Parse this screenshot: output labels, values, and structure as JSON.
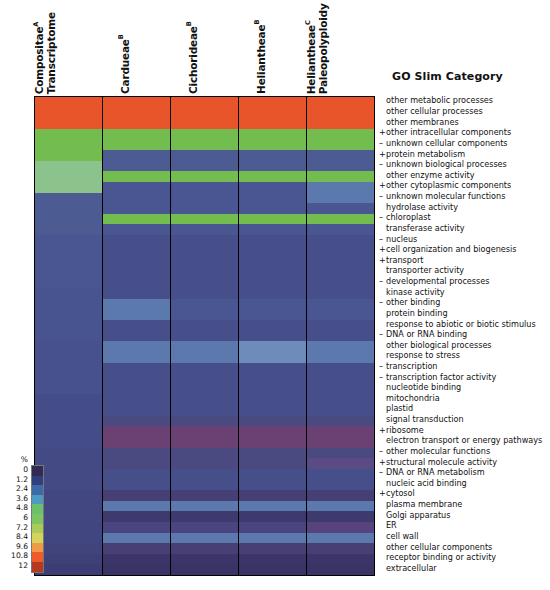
{
  "figure": {
    "type": "heatmap",
    "row_label_header": "GO Slim Category",
    "legend_unit": "%"
  },
  "columns": [
    {
      "id": "compositae-transcriptome",
      "lines": [
        "Compositae",
        "Transcriptome"
      ],
      "superscript": "A"
    },
    {
      "id": "cardueae",
      "lines": [
        "Cardueae"
      ],
      "superscript": "B"
    },
    {
      "id": "cichorideae",
      "lines": [
        "Cichorideae"
      ],
      "superscript": "B"
    },
    {
      "id": "heliantheae",
      "lines": [
        "Heliantheae"
      ],
      "superscript": "B"
    },
    {
      "id": "heliantheae-paleopolyploidy",
      "lines": [
        "Heliantheae",
        "Paleopolyploidy"
      ],
      "superscript": "C"
    }
  ],
  "rows": [
    {
      "prefix": "",
      "label": "other metabolic processes"
    },
    {
      "prefix": "",
      "label": "other cellular processes"
    },
    {
      "prefix": "",
      "label": "other membranes"
    },
    {
      "prefix": "+",
      "label": "other intracellular components"
    },
    {
      "prefix": "–",
      "label": "unknown cellular components"
    },
    {
      "prefix": "+",
      "label": "protein metabolism"
    },
    {
      "prefix": "–",
      "label": "unknown biological processes"
    },
    {
      "prefix": "",
      "label": "other enzyme activity"
    },
    {
      "prefix": "+",
      "label": "other cytoplasmic components"
    },
    {
      "prefix": "–",
      "label": "unknown molecular functions"
    },
    {
      "prefix": "",
      "label": "hydrolase activity"
    },
    {
      "prefix": "–",
      "label": "chloroplast"
    },
    {
      "prefix": "",
      "label": "transferase activity"
    },
    {
      "prefix": "–",
      "label": "nucleus"
    },
    {
      "prefix": "+",
      "label": "cell organization and biogenesis"
    },
    {
      "prefix": "+",
      "label": "transport"
    },
    {
      "prefix": "",
      "label": "transporter activity"
    },
    {
      "prefix": "–",
      "label": "developmental processes"
    },
    {
      "prefix": "",
      "label": "kinase activity"
    },
    {
      "prefix": "–",
      "label": "other binding"
    },
    {
      "prefix": "",
      "label": "protein binding"
    },
    {
      "prefix": "",
      "label": "response to abiotic or biotic stimulus"
    },
    {
      "prefix": "–",
      "label": "DNA or RNA binding"
    },
    {
      "prefix": "",
      "label": "other biological processes"
    },
    {
      "prefix": "",
      "label": "response to stress"
    },
    {
      "prefix": "–",
      "label": "transcription"
    },
    {
      "prefix": "–",
      "label": "transcription factor activity"
    },
    {
      "prefix": "",
      "label": "nucleotide binding"
    },
    {
      "prefix": "",
      "label": "mitochondria"
    },
    {
      "prefix": "",
      "label": "plastid"
    },
    {
      "prefix": "",
      "label": "signal transduction"
    },
    {
      "prefix": "+",
      "label": "ribosome"
    },
    {
      "prefix": "",
      "label": "electron transport or energy pathways"
    },
    {
      "prefix": "–",
      "label": "other molecular functions"
    },
    {
      "prefix": "+",
      "label": "structural molecule activity"
    },
    {
      "prefix": "–",
      "label": "DNA or RNA metabolism"
    },
    {
      "prefix": "",
      "label": "nucleic acid binding"
    },
    {
      "prefix": "+",
      "label": "cytosol"
    },
    {
      "prefix": "",
      "label": "plasma membrane"
    },
    {
      "prefix": "",
      "label": "Golgi apparatus"
    },
    {
      "prefix": "",
      "label": "ER"
    },
    {
      "prefix": "",
      "label": "cell wall"
    },
    {
      "prefix": "",
      "label": "other cellular components"
    },
    {
      "prefix": "",
      "label": "receptor binding or activity"
    },
    {
      "prefix": "",
      "label": "extracellular"
    }
  ],
  "legend": {
    "unit": "%",
    "ticks": [
      "0",
      "1.2",
      "2.4",
      "3.6",
      "4.8",
      "6",
      "7.2",
      "8.4",
      "9.6",
      "10.8",
      "12"
    ],
    "swatches": [
      "#312a52",
      "#30407e",
      "#3f6aa8",
      "#4b9bc4",
      "#6cc06a",
      "#7ec463",
      "#a8cb5a",
      "#d6d25a",
      "#ef9a46",
      "#ef5a28",
      "#b4391f"
    ]
  },
  "chart_data": {
    "type": "heatmap",
    "title": "",
    "xlabel": "",
    "ylabel": "GO Slim Category",
    "colorbar_label": "%",
    "colorbar_range": [
      0,
      12
    ],
    "colorbar_step": 1.2,
    "x_categories": [
      "Compositae Transcriptome",
      "Cardueae",
      "Cichorideae",
      "Heliantheae",
      "Heliantheae Paleopolyploidy"
    ],
    "y_categories": [
      "other metabolic processes",
      "other cellular processes",
      "other membranes",
      "other intracellular components",
      "unknown cellular components",
      "protein metabolism",
      "unknown biological processes",
      "other enzyme activity",
      "other cytoplasmic components",
      "unknown molecular functions",
      "hydrolase activity",
      "chloroplast",
      "transferase activity",
      "nucleus",
      "cell organization and biogenesis",
      "transport",
      "transporter activity",
      "developmental processes",
      "kinase activity",
      "other binding",
      "protein binding",
      "response to abiotic or biotic stimulus",
      "DNA or RNA binding",
      "other biological processes",
      "response to stress",
      "transcription",
      "transcription factor activity",
      "nucleotide binding",
      "mitochondria",
      "plastid",
      "signal transduction",
      "ribosome",
      "electron transport or energy pathways",
      "other molecular functions",
      "structural molecule activity",
      "DNA or RNA metabolism",
      "nucleic acid binding",
      "cytosol",
      "plasma membrane",
      "Golgi apparatus",
      "ER",
      "cell wall",
      "other cellular components",
      "receptor binding or activity",
      "extracellular"
    ],
    "values": [
      [
        10.9,
        10.9,
        10.9,
        10.9,
        10.9
      ],
      [
        10.9,
        10.9,
        10.9,
        10.9,
        10.9
      ],
      [
        10.9,
        10.4,
        10.4,
        10.4,
        10.4
      ],
      [
        6.2,
        6.3,
        6.3,
        6.3,
        6.3
      ],
      [
        6.2,
        6.1,
        6.1,
        6.1,
        6.1
      ],
      [
        6.2,
        2.1,
        2.1,
        2.1,
        2.1
      ],
      [
        5.2,
        2.0,
        2.0,
        2.0,
        2.0
      ],
      [
        5.2,
        5.9,
        5.9,
        5.9,
        5.9
      ],
      [
        5.2,
        1.9,
        1.9,
        1.9,
        2.8
      ],
      [
        2.0,
        1.9,
        1.9,
        1.9,
        2.7
      ],
      [
        2.0,
        1.9,
        1.9,
        1.9,
        1.9
      ],
      [
        2.0,
        5.8,
        5.8,
        5.8,
        5.8
      ],
      [
        2.0,
        1.8,
        1.8,
        1.8,
        1.8
      ],
      [
        2.0,
        1.8,
        1.8,
        1.8,
        1.8
      ],
      [
        2.0,
        5.7,
        5.7,
        5.7,
        5.7
      ],
      [
        1.9,
        1.7,
        1.7,
        1.7,
        1.7
      ],
      [
        1.9,
        1.7,
        1.7,
        1.7,
        1.7
      ],
      [
        1.9,
        1.6,
        1.6,
        1.6,
        1.6
      ],
      [
        1.9,
        1.6,
        1.6,
        1.6,
        1.6
      ],
      [
        1.9,
        2.4,
        1.9,
        1.9,
        1.9
      ],
      [
        1.9,
        2.4,
        1.9,
        1.9,
        1.9
      ],
      [
        1.9,
        1.5,
        1.5,
        1.5,
        1.5
      ],
      [
        1.8,
        1.5,
        1.5,
        1.5,
        1.5
      ],
      [
        1.8,
        2.3,
        2.3,
        2.9,
        2.3
      ],
      [
        1.8,
        2.3,
        2.3,
        2.9,
        2.3
      ],
      [
        1.8,
        1.4,
        1.4,
        1.4,
        1.4
      ],
      [
        1.8,
        1.4,
        1.4,
        1.4,
        1.4
      ],
      [
        1.7,
        1.4,
        1.4,
        1.4,
        1.4
      ],
      [
        1.7,
        1.3,
        1.3,
        1.3,
        1.3
      ],
      [
        1.7,
        1.3,
        1.3,
        1.3,
        1.3
      ],
      [
        1.6,
        1.2,
        1.2,
        1.2,
        1.2
      ],
      [
        1.6,
        1.2,
        1.2,
        1.2,
        1.2
      ],
      [
        1.6,
        0.9,
        0.9,
        0.9,
        0.9
      ],
      [
        1.5,
        0.8,
        0.8,
        0.8,
        0.8
      ],
      [
        1.5,
        0.8,
        0.8,
        0.8,
        1.0
      ],
      [
        1.5,
        1.1,
        1.1,
        1.1,
        1.1
      ],
      [
        1.4,
        1.1,
        1.1,
        1.1,
        1.1
      ],
      [
        1.4,
        0.7,
        0.7,
        0.7,
        0.7
      ],
      [
        1.4,
        2.2,
        2.2,
        2.2,
        2.2
      ],
      [
        1.3,
        0.6,
        0.6,
        0.6,
        0.6
      ],
      [
        1.3,
        1.0,
        1.0,
        1.0,
        1.0
      ],
      [
        1.3,
        0.9,
        0.9,
        0.9,
        0.9
      ],
      [
        1.2,
        0.5,
        0.5,
        0.5,
        0.5
      ],
      [
        1.2,
        0.4,
        0.4,
        0.4,
        0.4
      ],
      [
        1.2,
        0.3,
        0.3,
        0.3,
        0.3
      ]
    ],
    "cell_colors": [
      [
        "#e8552a",
        "#e8552a",
        "#e8552a",
        "#e8552a",
        "#e8552a"
      ],
      [
        "#e8552a",
        "#e8552a",
        "#e8552a",
        "#e8552a",
        "#e8552a"
      ],
      [
        "#e8552a",
        "#e8552a",
        "#e8552a",
        "#e8552a",
        "#e8552a"
      ],
      [
        "#73bc4f",
        "#73bc4f",
        "#73bc4f",
        "#73bc4f",
        "#73bc4f"
      ],
      [
        "#73bc4f",
        "#73bc4f",
        "#73bc4f",
        "#73bc4f",
        "#73bc4f"
      ],
      [
        "#73bc4f",
        "#4d5b93",
        "#4d5b93",
        "#4d5b93",
        "#4d5b93"
      ],
      [
        "#8cc38d",
        "#4d5b93",
        "#4d5b93",
        "#4d5b93",
        "#4d5b93"
      ],
      [
        "#8cc38d",
        "#73bc4f",
        "#73bc4f",
        "#73bc4f",
        "#73bc4f"
      ],
      [
        "#8cc38d",
        "#4a5691",
        "#4a5691",
        "#4a5691",
        "#5b79ad"
      ],
      [
        "#4d5b93",
        "#4a5691",
        "#4a5691",
        "#4a5691",
        "#5b79ad"
      ],
      [
        "#4d5b93",
        "#4a5691",
        "#4a5691",
        "#4a5691",
        "#4a5691"
      ],
      [
        "#4d5b93",
        "#73bc4f",
        "#73bc4f",
        "#73bc4f",
        "#73bc4f"
      ],
      [
        "#4d5b93",
        "#4a5691",
        "#4a5691",
        "#4a5691",
        "#4a5691"
      ],
      [
        "#4a5691",
        "#474f8a",
        "#474f8a",
        "#474f8a",
        "#474f8a"
      ],
      [
        "#4a5691",
        "#474f8a",
        "#474f8a",
        "#474f8a",
        "#474f8a"
      ],
      [
        "#4a5691",
        "#474f8a",
        "#474f8a",
        "#474f8a",
        "#474f8a"
      ],
      [
        "#4a5691",
        "#474f8a",
        "#474f8a",
        "#474f8a",
        "#474f8a"
      ],
      [
        "#4a5691",
        "#474f8a",
        "#474f8a",
        "#474f8a",
        "#474f8a"
      ],
      [
        "#485490",
        "#474f8a",
        "#474f8a",
        "#474f8a",
        "#474f8a"
      ],
      [
        "#485490",
        "#5b79ad",
        "#4a5691",
        "#4a5691",
        "#4a5691"
      ],
      [
        "#485490",
        "#5b79ad",
        "#4a5691",
        "#4a5691",
        "#4a5691"
      ],
      [
        "#485490",
        "#474f8a",
        "#474f8a",
        "#474f8a",
        "#474f8a"
      ],
      [
        "#485490",
        "#474f8a",
        "#474f8a",
        "#474f8a",
        "#474f8a"
      ],
      [
        "#46518d",
        "#5b79ad",
        "#5b79ad",
        "#6d8cbb",
        "#5b79ad"
      ],
      [
        "#46518d",
        "#5b79ad",
        "#5b79ad",
        "#6d8cbb",
        "#5b79ad"
      ],
      [
        "#46518d",
        "#474f8a",
        "#474f8a",
        "#474f8a",
        "#474f8a"
      ],
      [
        "#46518d",
        "#474f8a",
        "#474f8a",
        "#474f8a",
        "#474f8a"
      ],
      [
        "#46518d",
        "#474f8a",
        "#474f8a",
        "#474f8a",
        "#474f8a"
      ],
      [
        "#454d88",
        "#474f8a",
        "#474f8a",
        "#474f8a",
        "#474f8a"
      ],
      [
        "#454d88",
        "#474f8a",
        "#474f8a",
        "#474f8a",
        "#474f8a"
      ],
      [
        "#454d88",
        "#4b4a80",
        "#4b4a80",
        "#4b4a80",
        "#4b4a80"
      ],
      [
        "#454d88",
        "#6b4073",
        "#6b4073",
        "#6b4073",
        "#6b4073"
      ],
      [
        "#454d88",
        "#6b4073",
        "#6b4073",
        "#6b4073",
        "#6b4073"
      ],
      [
        "#434a84",
        "#4b4a80",
        "#4b4a80",
        "#4b4a80",
        "#4b4a80"
      ],
      [
        "#434a84",
        "#4b4a80",
        "#4b4a80",
        "#4b4a80",
        "#5a4b84"
      ],
      [
        "#434a84",
        "#474f8a",
        "#474f8a",
        "#474f8a",
        "#474f8a"
      ],
      [
        "#434a84",
        "#474f8a",
        "#474f8a",
        "#474f8a",
        "#474f8a"
      ],
      [
        "#424781",
        "#463f74",
        "#463f74",
        "#463f74",
        "#463f74"
      ],
      [
        "#424781",
        "#5b79ad",
        "#5b79ad",
        "#5b79ad",
        "#5b79ad"
      ],
      [
        "#424781",
        "#3f3a6e",
        "#3f3a6e",
        "#3f3a6e",
        "#3f3a6e"
      ],
      [
        "#414580",
        "#4a4480",
        "#4a4480",
        "#4a4480",
        "#57447e"
      ],
      [
        "#414580",
        "#5b79ad",
        "#5b79ad",
        "#5b79ad",
        "#5b79ad"
      ],
      [
        "#40437c",
        "#484075",
        "#484075",
        "#484075",
        "#484075"
      ],
      [
        "#3e4078",
        "#3b3569",
        "#3b3569",
        "#3b3569",
        "#3b3569"
      ],
      [
        "#3c3d74",
        "#3a3366",
        "#3a3366",
        "#3a3366",
        "#3a3366"
      ]
    ]
  }
}
